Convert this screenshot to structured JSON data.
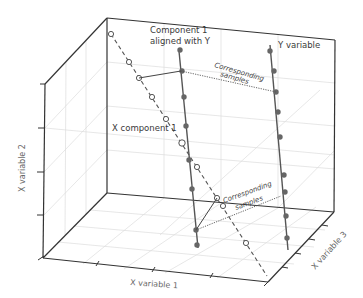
{
  "diagram": {
    "type": "3d-scatter-schematic",
    "axes": {
      "x1_label": "X variable 1",
      "x2_label": "X variable 2",
      "x3_label": "X variable 3"
    },
    "annotations": {
      "component_aligned_line1": "Component 1",
      "component_aligned_line2": "aligned with Y",
      "y_variable": "Y variable",
      "x_component": "X component 1",
      "corresponding_top_line1": "Corresponding",
      "corresponding_top_line2": "samples",
      "corresponding_bottom_line1": "Corresponding",
      "corresponding_bottom_line2": "samples"
    },
    "series": [
      {
        "name": "X component 1",
        "style": "dashed line, open circle markers",
        "point_count": 11
      },
      {
        "name": "Component 1 aligned with Y",
        "style": "solid line, filled dot markers",
        "point_count": 8
      },
      {
        "name": "Y variable",
        "style": "solid line, filled dot markers",
        "point_count": 8
      }
    ],
    "colors": {
      "axis": "#333333",
      "grid": "#d8d8d8",
      "series": "#555555",
      "marker_fill": "#666666"
    }
  }
}
